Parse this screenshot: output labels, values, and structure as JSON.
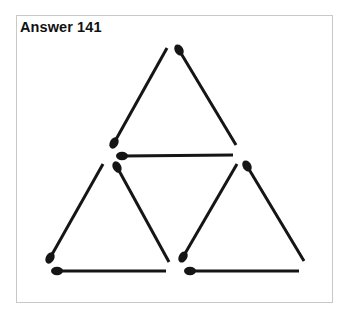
{
  "title": "Answer 141",
  "colors": {
    "match": "#151515",
    "frame": "#c9c9c9",
    "background": "#ffffff"
  },
  "matches": [
    {
      "id": "top-left",
      "head": [
        114,
        143
      ],
      "tail": [
        167,
        48
      ]
    },
    {
      "id": "top-right",
      "head": [
        179,
        50
      ],
      "tail": [
        236,
        145
      ]
    },
    {
      "id": "top-base",
      "head": [
        122,
        156
      ],
      "tail": [
        233,
        155
      ]
    },
    {
      "id": "left-tri-left",
      "head": [
        50,
        258
      ],
      "tail": [
        103,
        164
      ]
    },
    {
      "id": "left-tri-right",
      "head": [
        117,
        167
      ],
      "tail": [
        169,
        262
      ]
    },
    {
      "id": "left-tri-base",
      "head": [
        57,
        271
      ],
      "tail": [
        166,
        271
      ]
    },
    {
      "id": "right-tri-left",
      "head": [
        183,
        257
      ],
      "tail": [
        237,
        164
      ]
    },
    {
      "id": "right-tri-right",
      "head": [
        247,
        166
      ],
      "tail": [
        304,
        261
      ]
    },
    {
      "id": "right-tri-base",
      "head": [
        190,
        271
      ],
      "tail": [
        299,
        271
      ]
    }
  ]
}
